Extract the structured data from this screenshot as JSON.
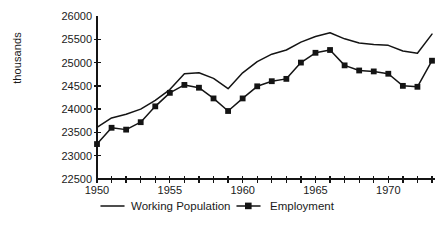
{
  "chart_data": {
    "type": "line",
    "title": "",
    "xlabel": "",
    "ylabel": "thousands",
    "xlim": [
      1950,
      1973
    ],
    "ylim": [
      22500,
      26000
    ],
    "yticks": [
      22500,
      23000,
      23500,
      24000,
      24500,
      25000,
      25500,
      26000
    ],
    "ytick_labels": [
      "22500",
      "23000",
      "23500",
      "24000",
      "24500",
      "25000",
      "25500",
      "26000"
    ],
    "xticks": [
      1950,
      1951,
      1952,
      1953,
      1954,
      1955,
      1956,
      1957,
      1958,
      1959,
      1960,
      1961,
      1962,
      1963,
      1964,
      1965,
      1966,
      1967,
      1968,
      1969,
      1970,
      1971,
      1972,
      1973
    ],
    "xtick_labels_shown": [
      "1950",
      "1955",
      "1960",
      "1965",
      "1970"
    ],
    "xtick_labels_shown_values": [
      1950,
      1955,
      1960,
      1965,
      1970
    ],
    "grid": false,
    "legend_position": "bottom",
    "x": [
      1950,
      1951,
      1952,
      1953,
      1954,
      1955,
      1956,
      1957,
      1958,
      1959,
      1960,
      1961,
      1962,
      1963,
      1964,
      1965,
      1966,
      1967,
      1968,
      1969,
      1970,
      1971,
      1972,
      1973
    ],
    "series": [
      {
        "name": "Working Population",
        "marker": "none",
        "values": [
          23610,
          23810,
          23890,
          24000,
          24190,
          24420,
          24760,
          24780,
          24660,
          24440,
          24780,
          25020,
          25180,
          25270,
          25440,
          25560,
          25640,
          25510,
          25420,
          25390,
          25370,
          25250,
          25200,
          25610
        ]
      },
      {
        "name": "Employment",
        "marker": "square",
        "values": [
          23250,
          23600,
          23560,
          23720,
          24060,
          24350,
          24520,
          24460,
          24230,
          23960,
          24230,
          24490,
          24600,
          24650,
          25000,
          25210,
          25270,
          24940,
          24830,
          24810,
          24760,
          24500,
          24480,
          25040
        ]
      }
    ]
  },
  "legend": {
    "items": [
      {
        "label": "Working Population",
        "style": "line"
      },
      {
        "label": "Employment",
        "style": "line-marker"
      }
    ]
  }
}
